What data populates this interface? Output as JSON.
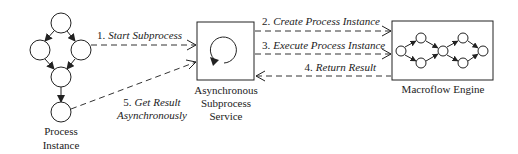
{
  "diagram": {
    "colors": {
      "stroke": "#222222",
      "background": "#ffffff",
      "text": "#222222"
    },
    "nodes": {
      "process_instance": {
        "label_line1": "Process",
        "label_line2": "Instance",
        "shape": "process-graph-of-5-circles"
      },
      "async_service": {
        "label_line1": "Asynchronous",
        "label_line2": "Subprocess",
        "label_line3": "Service",
        "icon": "circular-arrow-icon"
      },
      "macroflow_engine": {
        "label": "Macroflow Engine",
        "shape": "process-graph-of-7-circles"
      }
    },
    "edges": [
      {
        "num": "1.",
        "text": "Start Subprocess",
        "from": "process_instance",
        "to": "async_service",
        "style": "dashed"
      },
      {
        "num": "2.",
        "text": "Create Process Instance",
        "from": "async_service",
        "to": "macroflow_engine",
        "style": "dashed"
      },
      {
        "num": "3.",
        "text": "Execute Process Instance",
        "from": "async_service",
        "to": "macroflow_engine",
        "style": "dashed"
      },
      {
        "num": "4.",
        "text": "Return Result",
        "from": "macroflow_engine",
        "to": "async_service",
        "style": "dashed"
      },
      {
        "num": "5.",
        "text_line1": "Get Result",
        "text_line2": "Asynchronously",
        "from": "process_instance",
        "to": "async_service",
        "style": "dashed"
      }
    ]
  }
}
